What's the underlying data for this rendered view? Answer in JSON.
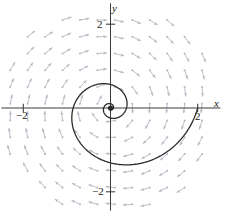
{
  "figure": {
    "kind": "phase-portrait",
    "width": 227,
    "height": 211,
    "background": "#ffffff"
  },
  "axes": {
    "x_axis_label": "x",
    "y_axis_label": "y",
    "x_ticks": [
      {
        "value": -2,
        "label": "−2"
      },
      {
        "value": 2,
        "label": "2"
      }
    ],
    "y_ticks": [
      {
        "value": 2,
        "label": "2"
      },
      {
        "value": -2,
        "label": "−2"
      }
    ],
    "axis_color": "#3a3a3a",
    "xlim": [
      -2.5,
      2.7
    ],
    "ylim": [
      -2.45,
      2.5
    ]
  },
  "chart_data": {
    "type": "scatter",
    "title": "",
    "xlabel": "x",
    "ylabel": "y",
    "xlim": [
      -2.5,
      2.7
    ],
    "ylim": [
      -2.45,
      2.5
    ],
    "grid": false,
    "legend": null,
    "annotations": [],
    "vector_field": {
      "description": "slope-field arrows of a clockwise inward spiral sink at the origin",
      "arrow_color": "#b9b9c4",
      "equilibrium_point": [
        0,
        0
      ],
      "rotation": "clockwise",
      "stability": "stable-spiral-sink",
      "decay_rate": 0.16,
      "angular_rate": 1.0,
      "grid_x": [
        -2.3,
        -1.9,
        -1.5,
        -1.1,
        -0.7,
        -0.3,
        0.1,
        0.5,
        0.9,
        1.3,
        1.7,
        2.1
      ],
      "grid_y": [
        -2.3,
        -1.9,
        -1.5,
        -1.1,
        -0.7,
        -0.3,
        0.1,
        0.5,
        0.9,
        1.3,
        1.7,
        2.1
      ]
    },
    "trajectory": {
      "name": "solution-curve",
      "color": "#2b2b2b",
      "start_point": [
        2,
        0
      ],
      "end_point": [
        0,
        0
      ],
      "direction": "clockwise inward",
      "r0": 2.0,
      "decay": 0.27,
      "turns": 2.35
    },
    "origin_marker": {
      "center": [
        0,
        0
      ],
      "radius_px": 2.6,
      "color": "#2b2b2b"
    }
  }
}
